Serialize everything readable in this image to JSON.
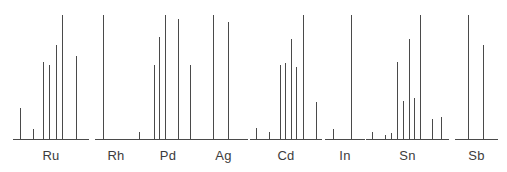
{
  "figure": {
    "title": "",
    "width": 507,
    "height": 172,
    "background_color": "#ffffff",
    "line_color": "#4a4a4a",
    "label_color": "#3c3c3c",
    "baseline_y": 137,
    "plot_top_y": 13
  },
  "labels": {
    "ru": "Ru",
    "rh": "Rh",
    "pd": "Pd",
    "ag": "Ag",
    "cd": "Cd",
    "in": "In",
    "sn": "Sn",
    "sb": "Sb"
  },
  "chart_data": {
    "type": "bar",
    "title": "",
    "subtitle": "",
    "xlabel": "",
    "ylabel": "",
    "ylim": [
      0,
      100
    ],
    "grid": false,
    "legend": "none",
    "categories": [
      "Ru",
      "Rh",
      "Pd",
      "Ag",
      "Cd",
      "In",
      "Sn",
      "Sb"
    ],
    "groups": [
      {
        "name": "Ru",
        "label": "Ru",
        "x_start_px": 13,
        "x_end_px": 89,
        "peaks": [
          {
            "x_px": 20,
            "height_pct": 25
          },
          {
            "x_px": 33,
            "height_pct": 8
          },
          {
            "x_px": 43,
            "height_pct": 62
          },
          {
            "x_px": 49,
            "height_pct": 60
          },
          {
            "x_px": 56,
            "height_pct": 76
          },
          {
            "x_px": 62,
            "height_pct": 100
          },
          {
            "x_px": 76,
            "height_pct": 67
          }
        ],
        "values": [
          25,
          8,
          62,
          60,
          76,
          100,
          67
        ]
      },
      {
        "name": "Rh",
        "label": "Rh",
        "x_start_px": 95,
        "x_end_px": 137,
        "peaks": [
          {
            "x_px": 103,
            "height_pct": 100
          }
        ],
        "values": [
          100
        ]
      },
      {
        "name": "Pd",
        "label": "Pd",
        "x_start_px": 133,
        "x_end_px": 203,
        "peaks": [
          {
            "x_px": 139,
            "height_pct": 6
          },
          {
            "x_px": 154,
            "height_pct": 60
          },
          {
            "x_px": 159,
            "height_pct": 82
          },
          {
            "x_px": 165,
            "height_pct": 100
          },
          {
            "x_px": 178,
            "height_pct": 97
          },
          {
            "x_px": 190,
            "height_pct": 60
          }
        ],
        "values": [
          6,
          60,
          82,
          100,
          97,
          60
        ]
      },
      {
        "name": "Ag",
        "label": "Ag",
        "x_start_px": 199,
        "x_end_px": 248,
        "peaks": [
          {
            "x_px": 213,
            "height_pct": 100
          },
          {
            "x_px": 228,
            "height_pct": 94
          }
        ],
        "values": [
          100,
          94
        ]
      },
      {
        "name": "Cd",
        "label": "Cd",
        "x_start_px": 250,
        "x_end_px": 322,
        "peaks": [
          {
            "x_px": 256,
            "height_pct": 9
          },
          {
            "x_px": 269,
            "height_pct": 6
          },
          {
            "x_px": 280,
            "height_pct": 60
          },
          {
            "x_px": 285,
            "height_pct": 61
          },
          {
            "x_px": 291,
            "height_pct": 81
          },
          {
            "x_px": 296,
            "height_pct": 58
          },
          {
            "x_px": 303,
            "height_pct": 100
          },
          {
            "x_px": 316,
            "height_pct": 30
          }
        ],
        "values": [
          9,
          6,
          60,
          61,
          81,
          58,
          100,
          30
        ]
      },
      {
        "name": "In",
        "label": "In",
        "x_start_px": 325,
        "x_end_px": 365,
        "peaks": [
          {
            "x_px": 333,
            "height_pct": 8
          },
          {
            "x_px": 351,
            "height_pct": 100
          }
        ],
        "values": [
          8,
          100
        ]
      },
      {
        "name": "Sn",
        "label": "Sn",
        "x_start_px": 366,
        "x_end_px": 449,
        "peaks": [
          {
            "x_px": 372,
            "height_pct": 6
          },
          {
            "x_px": 385,
            "height_pct": 3
          },
          {
            "x_px": 391,
            "height_pct": 5
          },
          {
            "x_px": 397,
            "height_pct": 62
          },
          {
            "x_px": 403,
            "height_pct": 31
          },
          {
            "x_px": 409,
            "height_pct": 81
          },
          {
            "x_px": 414,
            "height_pct": 33
          },
          {
            "x_px": 420,
            "height_pct": 100
          },
          {
            "x_px": 432,
            "height_pct": 16
          },
          {
            "x_px": 441,
            "height_pct": 18
          }
        ],
        "values": [
          6,
          3,
          5,
          62,
          31,
          81,
          33,
          100,
          16,
          18
        ]
      },
      {
        "name": "Sb",
        "label": "Sb",
        "x_start_px": 455,
        "x_end_px": 498,
        "peaks": [
          {
            "x_px": 468,
            "height_pct": 100
          },
          {
            "x_px": 483,
            "height_pct": 76
          }
        ],
        "values": [
          100,
          76
        ]
      }
    ]
  }
}
